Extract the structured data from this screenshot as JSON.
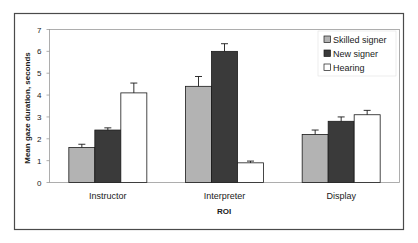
{
  "chart_data": {
    "type": "bar",
    "title": "",
    "xlabel": "ROI",
    "ylabel": "Mean gaze duration, seconds",
    "categories": [
      "Instructor",
      "Interpreter",
      "Display"
    ],
    "ylim": [
      0,
      7
    ],
    "yticks": [
      "0",
      "1",
      "2",
      "3",
      "4",
      "5",
      "6",
      "7"
    ],
    "grid": false,
    "legend_position": "top-right",
    "series": [
      {
        "name": "Skilled signer",
        "color": "#b3b3b3",
        "values": [
          1.6,
          4.4,
          2.2
        ],
        "error": [
          0.15,
          0.45,
          0.2
        ]
      },
      {
        "name": "New signer",
        "color": "#3a3a3a",
        "values": [
          2.4,
          6.0,
          2.8
        ],
        "error": [
          0.1,
          0.35,
          0.2
        ]
      },
      {
        "name": "Hearing",
        "color": "#ffffff",
        "values": [
          4.1,
          0.9,
          3.1
        ],
        "error": [
          0.45,
          0.08,
          0.2
        ]
      }
    ]
  }
}
